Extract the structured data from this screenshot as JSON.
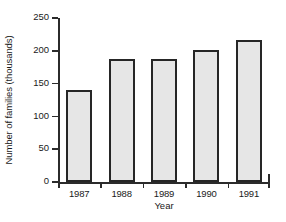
{
  "chart_data": {
    "type": "bar",
    "title": "",
    "xlabel": "Year",
    "ylabel": "Number of families (thousands)",
    "categories": [
      "1987",
      "1988",
      "1989",
      "1990",
      "1991"
    ],
    "values": [
      140,
      188,
      188,
      202,
      216
    ],
    "ylim": [
      0,
      250
    ],
    "yticks": [
      0,
      50,
      100,
      150,
      200,
      250
    ],
    "ytick_labels": [
      "0",
      "50",
      "100",
      "150",
      "200",
      "250"
    ],
    "grid": false,
    "legend": null,
    "bar_fill_color": "#e6e6e6",
    "bar_border_color": "#262626",
    "axis_color": "#2b2b2b",
    "background_color": "#ffffff"
  }
}
